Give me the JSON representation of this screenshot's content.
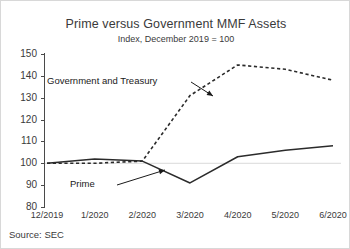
{
  "chart_data": {
    "type": "line",
    "title": "Prime versus Government MMF Assets",
    "subtitle": "Index, December 2019 = 100",
    "xlabel": "",
    "ylabel": "",
    "categories": [
      "12/2019",
      "1/2020",
      "2/2020",
      "3/2020",
      "4/2020",
      "5/2020",
      "6/2020"
    ],
    "series": [
      {
        "name": "Government and Treasury",
        "style": "dashed",
        "color": "#2b2b2b",
        "values": [
          100,
          100,
          101,
          131,
          145,
          143,
          138
        ]
      },
      {
        "name": "Prime",
        "style": "solid",
        "color": "#2b2b2b",
        "values": [
          100,
          102,
          101,
          91,
          103,
          106,
          108
        ]
      }
    ],
    "ylim": [
      80,
      150
    ],
    "yticks": [
      80,
      90,
      100,
      110,
      120,
      130,
      140,
      150
    ],
    "ytick_labels": [
      "80",
      "90",
      "100",
      "110",
      "120",
      "130",
      "140",
      "150"
    ],
    "grid": true,
    "gridlines": [
      100
    ],
    "legend": "none",
    "annotations": [
      {
        "text": "Government and Treasury",
        "target_category": "3/2020",
        "target_value": 131
      },
      {
        "text": "Prime",
        "target_category": "3/2020",
        "target_value": 96
      }
    ]
  },
  "source": {
    "text": "Source: SEC"
  }
}
